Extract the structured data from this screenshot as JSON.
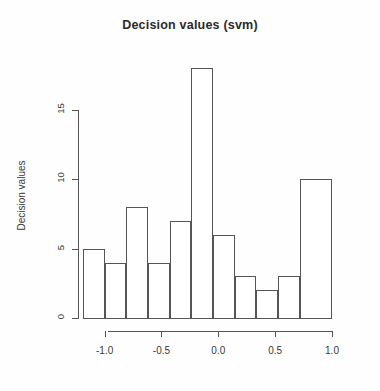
{
  "chart_data": {
    "type": "bar",
    "title": "Decision values (svm)",
    "subtitle": "",
    "xlabel": "",
    "ylabel": "Decision values",
    "grid": false,
    "legend": null,
    "xlim": [
      -1.1905,
      1.0
    ],
    "ylim": [
      0,
      18
    ],
    "bin_width": 0.1905,
    "categories": [
      "-1.19 to -1.00",
      "-1.00 to -0.81",
      "-0.81 to -0.62",
      "-0.62 to -0.43",
      "-0.43 to -0.24",
      "-0.24 to -0.05",
      "-0.05 to 0.14",
      "0.14 to 0.33",
      "0.33 to 0.52",
      "0.52 to 0.71",
      "0.71 to 1.00"
    ],
    "bin_edges": [
      -1.1905,
      -1.0,
      -0.8095,
      -0.619,
      -0.4286,
      -0.2381,
      -0.0476,
      0.1429,
      0.3333,
      0.5238,
      0.7143,
      1.0
    ],
    "values": [
      5,
      4,
      8,
      4,
      7,
      18,
      6,
      3,
      2,
      3,
      10
    ],
    "x_ticks": [
      -1.0,
      -0.5,
      0.0,
      0.5,
      1.0
    ],
    "x_tick_labels": [
      "-1.0",
      "-0.5",
      "0.0",
      "0.5",
      "1.0"
    ],
    "y_ticks": [
      0,
      5,
      10,
      15
    ],
    "y_tick_labels": [
      "0",
      "5",
      "10",
      "15"
    ],
    "bar_fill": "#ffffff",
    "bar_stroke": "#555555",
    "background": "#fefefe",
    "text_color": "#3a3a3a"
  }
}
